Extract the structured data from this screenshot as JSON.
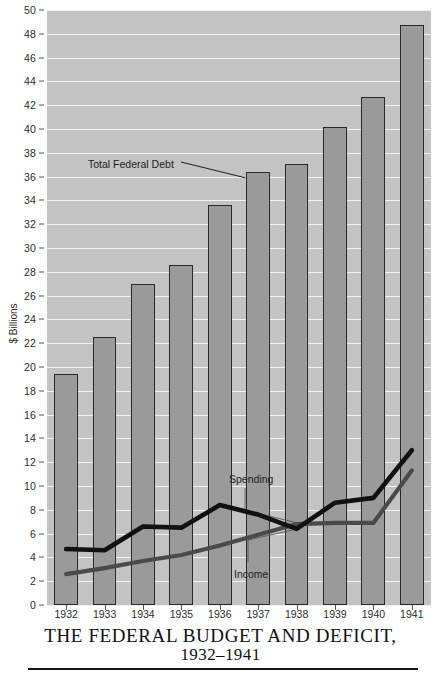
{
  "chart_data": {
    "type": "bar",
    "title": "THE FEDERAL BUDGET AND DEFICIT,",
    "subtitle": "1932–1941",
    "xlabel": "",
    "ylabel": "$ Billions",
    "ylim": [
      0,
      50
    ],
    "ytick_step": 2,
    "grid": true,
    "legend": "none",
    "categories": [
      "1932",
      "1933",
      "1934",
      "1935",
      "1936",
      "1937",
      "1938",
      "1939",
      "1940",
      "1941"
    ],
    "yticks": [
      "0",
      "2",
      "4",
      "6",
      "8",
      "10",
      "12",
      "14",
      "16",
      "18",
      "20",
      "22",
      "24",
      "26",
      "28",
      "30",
      "32",
      "34",
      "36",
      "38",
      "40",
      "42",
      "44",
      "46",
      "48",
      "50"
    ],
    "values": [
      19.4,
      22.5,
      27.0,
      28.6,
      33.6,
      36.4,
      37.1,
      40.2,
      42.7,
      48.7
    ],
    "bar_series_name": "Total Federal Debt",
    "series": [
      {
        "name": "Total Federal Debt",
        "kind": "bar",
        "values": [
          19.4,
          22.5,
          27.0,
          28.6,
          33.6,
          36.4,
          37.1,
          40.2,
          42.7,
          48.7
        ],
        "color": "#9a9a9a",
        "edge_color": "#2a2a2a"
      },
      {
        "name": "Spending",
        "kind": "line",
        "values": [
          4.7,
          4.6,
          6.6,
          6.5,
          8.4,
          7.6,
          6.4,
          8.6,
          9.0,
          13.0
        ],
        "color": "#111111"
      },
      {
        "name": "Income",
        "kind": "line",
        "values": [
          2.6,
          3.1,
          3.7,
          4.2,
          5.0,
          5.9,
          6.8,
          6.9,
          6.9,
          11.3
        ],
        "color": "#4a4a4a"
      }
    ],
    "annotations": [
      {
        "text": "Total Federal Debt",
        "points_to": "1937 bar"
      },
      {
        "text": "Spending",
        "points_to": "spending line"
      },
      {
        "text": "Income",
        "points_to": "income line"
      }
    ]
  },
  "colors": {
    "plot_background": "#c3c3c3",
    "gridline": "#f2f2f2",
    "bar_fill": "#9a9a9a",
    "bar_edge": "#2a2a2a",
    "spending_line": "#111111",
    "income_line": "#4a4a4a",
    "page_background": "#ffffff",
    "text": "#1d1d1d"
  },
  "annotations": {
    "debt": "Total Federal Debt",
    "spending": "Spending",
    "income": "Income"
  },
  "axis": {
    "y_title": "$ Billions"
  },
  "title": {
    "line1": "THE FEDERAL BUDGET AND DEFICIT,",
    "line2": "1932–1941"
  }
}
